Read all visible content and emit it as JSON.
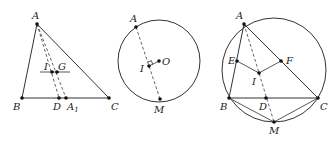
{
  "figures": [
    {
      "id": "fig1",
      "description": "Triangle ABC with incenter I, centroid G, line IG parallel to BC, cevians AD and AA1 dashed",
      "points": {
        "A": {
          "label": "A",
          "x": 37,
          "y": 24
        },
        "B": {
          "label": "B",
          "x": 22,
          "y": 98
        },
        "C": {
          "label": "C",
          "x": 109,
          "y": 98
        },
        "D": {
          "label": "D",
          "x": 59,
          "y": 98
        },
        "A1": {
          "label": "A",
          "sub": "1",
          "x": 66,
          "y": 98
        },
        "I": {
          "label": "I",
          "x": 52,
          "y": 72
        },
        "G": {
          "label": "G",
          "x": 57,
          "y": 72
        }
      }
    },
    {
      "id": "fig2",
      "description": "Circle with center O, chord through A and M, incenter I with OI perpendicular to AM",
      "points": {
        "A": {
          "label": "A",
          "x": 136,
          "y": 27
        },
        "M": {
          "label": "M",
          "x": 160,
          "y": 99
        },
        "I": {
          "label": "I",
          "x": 149,
          "y": 66
        },
        "O": {
          "label": "O",
          "x": 159,
          "y": 61
        }
      },
      "circle": {
        "cx": 159,
        "cy": 61,
        "r": 41
      }
    },
    {
      "id": "fig3",
      "description": "Triangle ABC inscribed in circle, incenter I, E on AB, F on AC, D on BC, M midpoint of arc BC",
      "points": {
        "A": {
          "label": "A",
          "x": 244,
          "y": 24
        },
        "B": {
          "label": "B",
          "x": 229,
          "y": 98
        },
        "C": {
          "label": "C",
          "x": 318,
          "y": 98
        },
        "E": {
          "label": "E",
          "x": 237,
          "y": 61
        },
        "F": {
          "label": "F",
          "x": 281,
          "y": 61
        },
        "I": {
          "label": "I",
          "x": 259,
          "y": 73
        },
        "D": {
          "label": "D",
          "x": 266,
          "y": 98
        },
        "M": {
          "label": "M",
          "x": 274,
          "y": 122
        }
      },
      "circle": {
        "cx": 274,
        "cy": 70,
        "r": 52
      }
    }
  ],
  "labels": {
    "f1_A": "A",
    "f1_B": "B",
    "f1_C": "C",
    "f1_D": "D",
    "f1_A1": "A",
    "f1_A1_sub": "1",
    "f1_I": "I",
    "f1_G": "G",
    "f2_A": "A",
    "f2_M": "M",
    "f2_I": "I",
    "f2_O": "O",
    "f3_A": "A",
    "f3_B": "B",
    "f3_C": "C",
    "f3_D": "D",
    "f3_E": "E",
    "f3_F": "F",
    "f3_I": "I",
    "f3_M": "M"
  }
}
